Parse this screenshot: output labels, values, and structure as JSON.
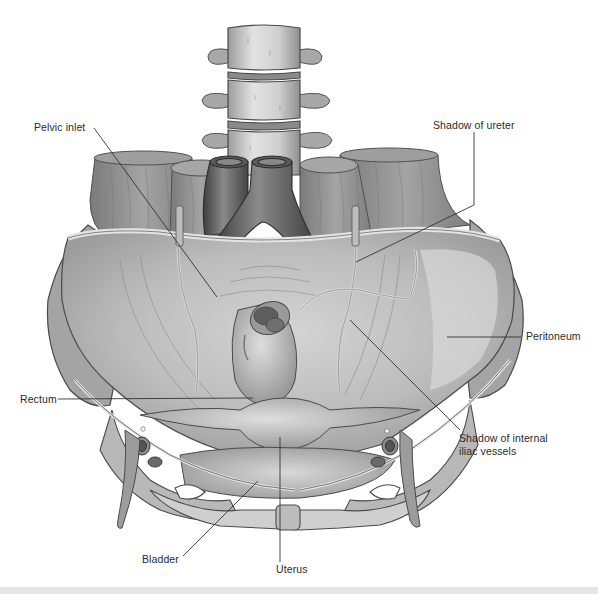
{
  "figure": {
    "background": "#ffffff",
    "palette": {
      "muscle": "#8c8c8c",
      "muscle_dark": "#6e6e6e",
      "muscle_light": "#a8a8a8",
      "bone": "#c9c9c9",
      "bone_dark": "#9a9a9a",
      "vessel": "#6a6a6a",
      "vessel_dark": "#4a4a4a",
      "peritoneum": "#bdbdbd",
      "peritoneum_light": "#d6d6d6",
      "organ": "#b0b0b0",
      "line": "#333333",
      "strip": "#e6e6e6"
    }
  },
  "labels": [
    {
      "id": "pelvic-inlet",
      "text": "Pelvic inlet",
      "x": 34,
      "y": 121,
      "leader": [
        [
          94,
          128
        ],
        [
          217,
          297
        ]
      ]
    },
    {
      "id": "shadow-of-ureter",
      "text": "Shadow of ureter",
      "x": 433,
      "y": 119,
      "leader": [
        [
          474,
          132
        ],
        [
          474,
          205
        ],
        [
          356,
          262
        ]
      ]
    },
    {
      "id": "peritoneum",
      "text": "Peritoneum",
      "x": 526,
      "y": 330,
      "leader": [
        [
          521,
          337
        ],
        [
          447,
          337
        ]
      ]
    },
    {
      "id": "shadow-of-internal-iliac-vessels",
      "text": "Shadow of internal",
      "text2": "iliac vessels",
      "x": 459,
      "y": 432,
      "leader": [
        [
          460,
          430
        ],
        [
          350,
          320
        ]
      ]
    },
    {
      "id": "rectum",
      "text": "Rectum",
      "x": 20,
      "y": 393,
      "leader": [
        [
          58,
          399
        ],
        [
          253,
          398
        ]
      ]
    },
    {
      "id": "bladder",
      "text": "Bladder",
      "x": 142,
      "y": 553,
      "leader": [
        [
          183,
          556
        ],
        [
          258,
          481
        ]
      ]
    },
    {
      "id": "uterus",
      "text": "Uterus",
      "x": 276,
      "y": 563,
      "leader": [
        [
          280,
          562
        ],
        [
          280,
          437
        ]
      ]
    }
  ]
}
